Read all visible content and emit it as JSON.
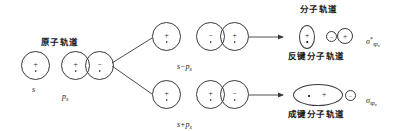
{
  "diagram": {
    "title_atomic": "原子轨道",
    "title_molecular": "分子轨道",
    "label_antibonding": "反键分子轨道",
    "label_bonding": "成键分子轨道",
    "label_s": "s",
    "label_px_base": "p",
    "label_px_sub": "x",
    "label_combo_minus": "s−p",
    "label_combo_minus_sub": "x",
    "label_combo_plus": "s+p",
    "label_combo_plus_sub": "x",
    "sigma_star": {
      "symbol": "σ",
      "superscript": "*",
      "subscript": "sp",
      "subscript_sub": "x"
    },
    "sigma_bond": {
      "symbol": "σ",
      "superscript": "",
      "subscript": "sp",
      "subscript_sub": "x"
    },
    "signs": {
      "plus": "+",
      "minus": "−"
    },
    "colors": {
      "stroke": "#3a3a3a",
      "text": "#1a1a1a",
      "background": "#ffffff"
    }
  }
}
